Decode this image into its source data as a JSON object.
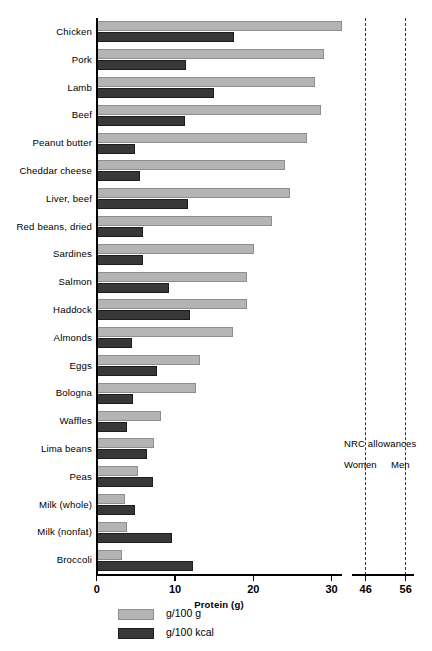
{
  "chart_data": {
    "type": "bar",
    "title": "",
    "xlabel": "Protein (g)",
    "ylabel": "",
    "orientation": "horizontal",
    "grid": false,
    "xlim": [
      0,
      32
    ],
    "xticks": [
      0,
      10,
      20,
      30
    ],
    "xticklabels": [
      "0",
      "10",
      "20",
      "30"
    ],
    "broken_axis_panel": {
      "ticks": [
        46,
        56
      ],
      "ticklabels": [
        "46",
        "56"
      ],
      "title": "NRC allowances",
      "series_labels": [
        "Women",
        "Men"
      ]
    },
    "legend": {
      "position": "bottom-left",
      "entries": [
        {
          "label": "g/100 g",
          "color": "#b4b4b4"
        },
        {
          "label": "g/100 kcal",
          "color": "#383838"
        }
      ]
    },
    "categories": [
      "Chicken",
      "Pork",
      "Lamb",
      "Beef",
      "Peanut butter",
      "Cheddar cheese",
      "Liver, beef",
      "Red beans, dried",
      "Sardines",
      "Salmon",
      "Haddock",
      "Almonds",
      "Eggs",
      "Bologna",
      "Waffles",
      "Lima beans",
      "Peas",
      "Milk (whole)",
      "Milk (nonfat)",
      "Broccoli"
    ],
    "series": [
      {
        "name": "g/100 g",
        "color": "#b4b4b4",
        "values": [
          31.3,
          29.0,
          27.8,
          28.6,
          26.8,
          24.0,
          24.7,
          22.4,
          20.0,
          19.2,
          19.2,
          17.4,
          13.2,
          12.7,
          8.2,
          7.3,
          5.2,
          3.6,
          3.8,
          3.2
        ]
      },
      {
        "name": "g/100 kcal",
        "color": "#383838",
        "values": [
          17.5,
          11.4,
          14.9,
          11.3,
          4.9,
          5.5,
          11.6,
          5.9,
          5.9,
          9.2,
          11.9,
          4.5,
          7.7,
          4.6,
          3.8,
          6.4,
          7.1,
          4.9,
          9.6,
          12.3
        ]
      }
    ]
  },
  "colors": {
    "light_bar": "#b4b4b4",
    "dark_bar": "#383838",
    "axis": "#000000",
    "dashed_line": "#333333",
    "background": "#ffffff"
  }
}
